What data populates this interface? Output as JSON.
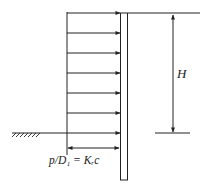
{
  "diagram": {
    "type": "retaining-wall-pressure",
    "labels": {
      "height": "H",
      "pressure_equation": "p/D₁ = Kᵣc"
    },
    "pressure_arrows": {
      "count": 7,
      "y_positions": [
        13,
        33,
        53,
        73,
        93,
        113,
        133
      ],
      "x_start": 67,
      "x_end": 120
    },
    "double_arrow": {
      "y": 148,
      "x_start": 67,
      "x_end": 120
    },
    "wall": {
      "x": 120,
      "y": 13,
      "width": 7,
      "height": 167
    },
    "dimension": {
      "x": 173,
      "y_top": 14,
      "y_bottom": 133
    },
    "colors": {
      "line": "#222222",
      "background": "#ffffff"
    }
  }
}
